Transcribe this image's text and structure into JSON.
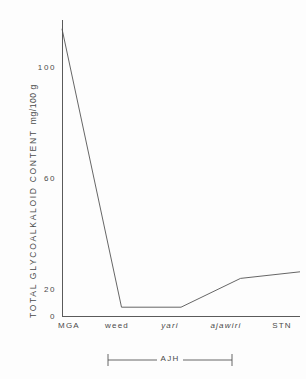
{
  "chart_data": {
    "type": "line",
    "title": "",
    "xlabel": "",
    "ylabel": "TOTAL  GLYCOALKALOID  CONTENT",
    "yunit": "mg/100 g",
    "categories": [
      "MGA",
      "weed",
      "yari",
      "ajawiri",
      "STN"
    ],
    "categories_italic": [
      false,
      false,
      true,
      true,
      false
    ],
    "values": [
      130,
      4,
      4,
      17,
      20
    ],
    "ylim": [
      0,
      134
    ],
    "yticks": [
      0,
      20,
      60,
      100
    ],
    "ytick_labels": [
      "0",
      "20",
      "60",
      "100"
    ],
    "grid": false,
    "legend": "none",
    "line_color": "#555555",
    "annotations": [
      {
        "label": "AJH",
        "type": "range-bracket",
        "from": "weed",
        "to": "ajawiri",
        "position": "below-axis"
      }
    ]
  },
  "axis": {
    "ytick_labels": [
      "100",
      "60",
      "20",
      "0"
    ],
    "xtick_labels": [
      "MGA",
      "weed",
      "yari",
      "ajawiri",
      "STN"
    ]
  },
  "bracket": {
    "label": "AJH"
  }
}
